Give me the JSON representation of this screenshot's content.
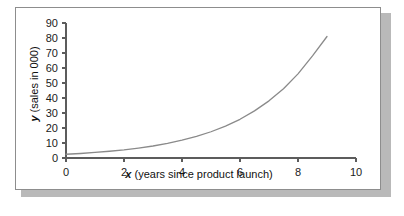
{
  "figure": {
    "background_color": "#ffffff",
    "frame_border_color": "#8d8d8d",
    "shadow_color": "#b9b9b9"
  },
  "chart_data": {
    "type": "line",
    "title": "",
    "subtitle": "",
    "xlabel_var": "x",
    "xlabel_rest": " (years since product launch)",
    "xlabel": "x (years since product launch)",
    "ylabel_var": "y",
    "ylabel_rest": " (sales in 000)",
    "ylabel": "y (sales in 000)",
    "xlim": [
      0,
      10
    ],
    "ylim": [
      0,
      90
    ],
    "xticks": [
      0,
      2,
      4,
      6,
      8,
      10
    ],
    "xtick_labels": [
      "0",
      "2",
      "4",
      "6",
      "8",
      "10"
    ],
    "yticks": [
      0,
      10,
      20,
      30,
      40,
      50,
      60,
      70,
      80,
      90
    ],
    "ytick_labels": [
      "0",
      "10",
      "20",
      "30",
      "40",
      "50",
      "60",
      "70",
      "80",
      "90"
    ],
    "grid": false,
    "legend": false,
    "legend_position": "none",
    "series": [
      {
        "name": "sales",
        "color": "#8a8a8a",
        "line_width": 1.3,
        "marker": "none",
        "x": [
          0,
          0.5,
          1,
          1.5,
          2,
          2.5,
          3,
          3.5,
          4,
          4.5,
          5,
          5.5,
          6,
          6.5,
          7,
          7.5,
          8,
          8.5,
          9
        ],
        "values": [
          2.5,
          3.0,
          3.7,
          4.5,
          5.4,
          6.6,
          8.0,
          9.8,
          11.9,
          14.4,
          17.5,
          21.3,
          25.8,
          31.4,
          38.1,
          46.2,
          56.1,
          68.1,
          81.0
        ]
      }
    ],
    "axis_color": "#5c5c5c"
  }
}
